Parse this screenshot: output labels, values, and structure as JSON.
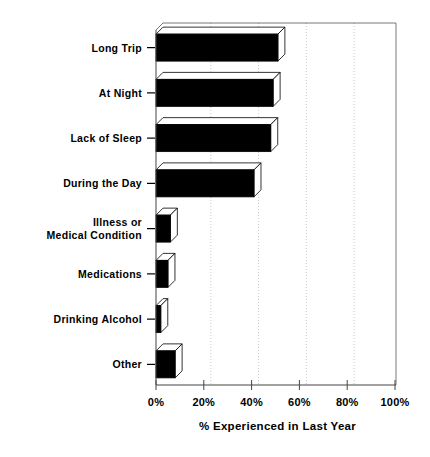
{
  "chart_data": {
    "type": "bar",
    "orientation": "horizontal",
    "title": "",
    "xlabel": "% Experienced in Last Year",
    "ylabel": "",
    "xlim": [
      0,
      100
    ],
    "xticks": [
      "0%",
      "20%",
      "40%",
      "60%",
      "80%",
      "100%"
    ],
    "xtick_values": [
      0,
      20,
      40,
      60,
      80,
      100
    ],
    "grid": "vertical-dotted",
    "legend": "none",
    "style": "3d-extruded-bars",
    "bar_face_color": "#000000",
    "bar_side_color": "#ffffff",
    "categories": [
      "Long Trip",
      "At Night",
      "Lack of Sleep",
      "During the Day",
      "Illness or Medical Condition",
      "Medications",
      "Drinking Alcohol",
      "Other"
    ],
    "category_label_lines": [
      [
        "Long Trip"
      ],
      [
        "At Night"
      ],
      [
        "Lack of Sleep"
      ],
      [
        "During the Day"
      ],
      [
        "Illness or",
        "Medical Condition"
      ],
      [
        "Medications"
      ],
      [
        "Drinking Alcohol"
      ],
      [
        "Other"
      ]
    ],
    "values": [
      51,
      49,
      48,
      41,
      6,
      5,
      2,
      8
    ]
  }
}
